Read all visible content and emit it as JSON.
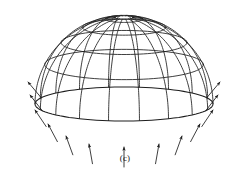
{
  "figure": {
    "caption": "(c)",
    "kind": "line-drawing",
    "stroke_color": "#1d1d1d",
    "background_color": "#ffffff",
    "icons": {
      "dome": "dome-wireframe-icon",
      "load": "load-arrow-icon"
    }
  },
  "chart_data": {
    "type": "line",
    "subtitle": "(c)",
    "xlabel": "",
    "ylabel": "",
    "grid": true,
    "legend": "none",
    "xlim": [
      0,
      250
    ],
    "ylim": [
      0,
      177
    ],
    "projection": {
      "center_x": 124,
      "apex_y": 17,
      "base_center_y": 104,
      "base_rx": 89,
      "base_ry": 17,
      "perspective_ratio": 0.19
    },
    "geometry": {
      "meridian_count": 18,
      "parallel_count": 5,
      "parallel_latitudes_deg": [
        12,
        28,
        45,
        63,
        90
      ],
      "apex_hole_radius_px": 9
    },
    "series": [
      {
        "name": "meridians",
        "count": 18,
        "description": "radial great-circle arcs from apex to rim"
      },
      {
        "name": "parallels",
        "count": 5,
        "description": "horizontal ellipse rings of increasing radius"
      },
      {
        "name": "edge-loads",
        "count": 13,
        "description": "arrows pointing inward and upward at the dome rim",
        "arrows": [
          {
            "x": 28,
            "y": 82,
            "angle_deg": -40,
            "length": 20
          },
          {
            "x": 30,
            "y": 95,
            "angle_deg": -38,
            "length": 20
          },
          {
            "x": 35,
            "y": 110,
            "angle_deg": -34,
            "length": 20
          },
          {
            "x": 48,
            "y": 124,
            "angle_deg": -28,
            "length": 20
          },
          {
            "x": 66,
            "y": 136,
            "angle_deg": -20,
            "length": 20
          },
          {
            "x": 89,
            "y": 144,
            "angle_deg": -10,
            "length": 20
          },
          {
            "x": 124,
            "y": 147,
            "angle_deg": 0,
            "length": 20
          },
          {
            "x": 159,
            "y": 144,
            "angle_deg": 10,
            "length": 20
          },
          {
            "x": 182,
            "y": 136,
            "angle_deg": 20,
            "length": 20
          },
          {
            "x": 200,
            "y": 124,
            "angle_deg": 28,
            "length": 20
          },
          {
            "x": 213,
            "y": 110,
            "angle_deg": 34,
            "length": 20
          },
          {
            "x": 218,
            "y": 95,
            "angle_deg": 38,
            "length": 20
          },
          {
            "x": 220,
            "y": 82,
            "angle_deg": 40,
            "length": 20
          }
        ]
      }
    ]
  }
}
